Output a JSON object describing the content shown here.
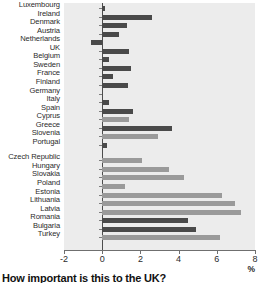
{
  "caption": "How important is this to the UK?",
  "unit_label": "%",
  "colors": {
    "bar_dark": "#4a4a4a",
    "bar_light": "#9a9a9a",
    "plot_background": "#ececec",
    "axis": "#6f6f6f",
    "zero_line": "#4d4d4d",
    "text": "#2b2b2b"
  },
  "chart_data": {
    "type": "bar",
    "orientation": "horizontal",
    "title": "How important is this to the UK?",
    "xlabel": "%",
    "ylabel": "",
    "xlim": [
      -2,
      8
    ],
    "xticks": [
      -2,
      0,
      2,
      4,
      6,
      8
    ],
    "xticklabels": [
      "-2",
      "0",
      "2",
      "4",
      "6",
      "8"
    ],
    "grid": false,
    "legend": "none",
    "categories": [
      "Luxembourg",
      "Ireland",
      "Denmark",
      "Austria",
      "Netherlands",
      "UK",
      "Belgium",
      "Sweden",
      "France",
      "Finland",
      "Germany",
      "Italy",
      "Spain",
      "Cyprus",
      "Greece",
      "Slovenia",
      "Portugal",
      "Czech Republic",
      "Hungary",
      "Slovakia",
      "Poland",
      "Estonia",
      "Lithuania",
      "Latvia",
      "Romania",
      "Bulgaria",
      "Turkey"
    ],
    "values": [
      0.15,
      2.6,
      1.3,
      0.9,
      -0.6,
      1.4,
      0.35,
      1.5,
      0.55,
      1.35,
      0.0,
      0.35,
      1.6,
      1.4,
      3.65,
      2.9,
      0.25,
      2.1,
      3.5,
      4.3,
      1.2,
      6.25,
      6.95,
      7.25,
      4.5,
      4.9,
      6.15
    ],
    "bar_shades": [
      "dark",
      "dark",
      "dark",
      "dark",
      "dark",
      "dark",
      "dark",
      "dark",
      "dark",
      "dark",
      "dark",
      "dark",
      "dark",
      "light",
      "dark",
      "light",
      "dark",
      "light",
      "light",
      "light",
      "light",
      "light",
      "light",
      "light",
      "dark",
      "dark",
      "light"
    ],
    "group_break_after": "Portugal"
  }
}
